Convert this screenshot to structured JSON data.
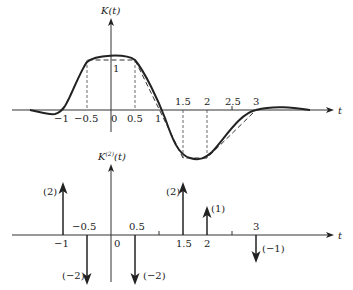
{
  "top_plot": {
    "ylabel": "K(t)",
    "xlabel": "t",
    "x_ticks": [
      {
        "t": -1,
        "label": "−1"
      },
      {
        "t": -0.5,
        "label": "−0.5"
      },
      {
        "t": 0,
        "label": "0"
      },
      {
        "t": 0.5,
        "label": "0.5"
      },
      {
        "t": 1,
        "label": "1"
      },
      {
        "t": 1.5,
        "label": "1.5"
      },
      {
        "t": 2,
        "label": "2"
      },
      {
        "t": 2.5,
        "label": "2.5"
      },
      {
        "t": 3,
        "label": "3"
      }
    ],
    "plateau_label": "1"
  },
  "bottom_plot": {
    "ylabel": "K",
    "ylabel_sup": "(2)",
    "ylabel_arg": "(t)",
    "xlabel": "t",
    "x_ticks": [
      {
        "t": -1,
        "label": "−1"
      },
      {
        "t": -0.5,
        "label": "−0.5"
      },
      {
        "t": 0,
        "label": "0"
      },
      {
        "t": 0.5,
        "label": "0.5"
      },
      {
        "t": 1.5,
        "label": "1.5"
      },
      {
        "t": 2,
        "label": "2"
      },
      {
        "t": 3,
        "label": "3"
      }
    ],
    "impulses": [
      {
        "t": -1,
        "weight": 2,
        "label": "(2)"
      },
      {
        "t": -0.5,
        "weight": -2,
        "label": "(−2)"
      },
      {
        "t": 0.5,
        "weight": -2,
        "label": "(−2)"
      },
      {
        "t": 1.5,
        "weight": 2,
        "label": "(2)"
      },
      {
        "t": 2,
        "weight": 1,
        "label": "(1)"
      },
      {
        "t": 3,
        "weight": -1,
        "label": "(−1)"
      }
    ]
  }
}
